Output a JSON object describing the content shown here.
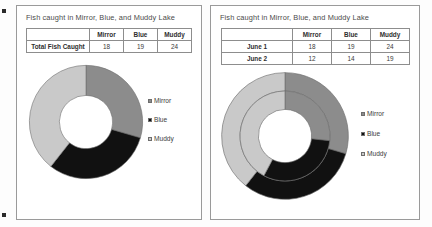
{
  "document": {
    "background": "#fdfdfd",
    "marker_color": "#2b2b2b"
  },
  "series_colors": {
    "Mirror": "#8c8c8c",
    "Blue": "#111111",
    "Muddy": "#c9c9c9"
  },
  "legend": {
    "items": [
      {
        "label": "Mirror",
        "color": "#8c8c8c"
      },
      {
        "label": "Blue",
        "color": "#111111"
      },
      {
        "label": "Muddy",
        "color": "#c9c9c9"
      }
    ]
  },
  "left_panel": {
    "title": "Fish caught in Mirror, Blue, and Muddy Lake",
    "table": {
      "headers": [
        "",
        "Mirror",
        "Blue",
        "Muddy"
      ],
      "rows": [
        {
          "label": "Total Fish Caught",
          "values": [
            18,
            19,
            24
          ]
        }
      ]
    }
  },
  "right_panel": {
    "title": "Fish caught in Mirror, Blue, and Muddy Lake",
    "table": {
      "headers": [
        "",
        "Mirror",
        "Blue",
        "Muddy"
      ],
      "rows": [
        {
          "label": "June 1",
          "values": [
            18,
            19,
            24
          ]
        },
        {
          "label": "June 2",
          "values": [
            12,
            14,
            19
          ]
        }
      ]
    }
  },
  "chart_data": [
    {
      "type": "pie",
      "variant": "doughnut",
      "title": "Fish caught in Mirror, Blue, and Muddy Lake",
      "panel": "left",
      "labels": [
        "Mirror",
        "Blue",
        "Muddy"
      ],
      "values": [
        18,
        19,
        24
      ],
      "total": 61,
      "colors": [
        "#8c8c8c",
        "#111111",
        "#c9c9c9"
      ],
      "legend_position": "right",
      "start_angle": 0,
      "direction": "clockwise",
      "hole_ratio": 0.47,
      "rings": [
        {
          "name": "Total Fish Caught",
          "values": [
            18,
            19,
            24
          ]
        }
      ]
    },
    {
      "type": "pie",
      "variant": "doughnut",
      "title": "Fish caught in Mirror, Blue, and Muddy Lake",
      "panel": "right",
      "labels": [
        "Mirror",
        "Blue",
        "Muddy"
      ],
      "colors": [
        "#8c8c8c",
        "#111111",
        "#c9c9c9"
      ],
      "legend_position": "right",
      "start_angle": 0,
      "direction": "clockwise",
      "hole_ratio": 0.42,
      "rings": [
        {
          "name": "June 1",
          "values": [
            18,
            19,
            24
          ],
          "total": 61
        },
        {
          "name": "June 2",
          "values": [
            12,
            14,
            19
          ],
          "total": 45
        }
      ]
    }
  ]
}
